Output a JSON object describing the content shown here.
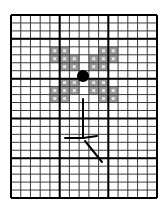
{
  "grid": {
    "left": 11,
    "top": 15,
    "right": 157,
    "bottom": 198,
    "cols": 15,
    "rows": 23,
    "major_cols": [
      0,
      5,
      10,
      15
    ],
    "major_rows": [
      0,
      3,
      8,
      13,
      18,
      23
    ],
    "minor_color": "#3a3a3a",
    "major_color": "#000000",
    "minor_width": 1,
    "major_width": 2
  },
  "shaded_cells": {
    "fill": "#9a9a9a",
    "center_mark": "#e6e6e6",
    "cells": [
      [
        4,
        4
      ],
      [
        4,
        5
      ],
      [
        5,
        4
      ],
      [
        5,
        5
      ],
      [
        5,
        6
      ],
      [
        6,
        5
      ],
      [
        6,
        6
      ],
      [
        4,
        9
      ],
      [
        4,
        10
      ],
      [
        5,
        8
      ],
      [
        5,
        9
      ],
      [
        5,
        10
      ],
      [
        6,
        8
      ],
      [
        6,
        9
      ],
      [
        8,
        5
      ],
      [
        8,
        6
      ],
      [
        9,
        4
      ],
      [
        9,
        5
      ],
      [
        9,
        6
      ],
      [
        10,
        4
      ],
      [
        10,
        5
      ],
      [
        8,
        8
      ],
      [
        8,
        9
      ],
      [
        9,
        8
      ],
      [
        9,
        9
      ],
      [
        9,
        10
      ],
      [
        10,
        9
      ],
      [
        10,
        10
      ]
    ]
  },
  "center_dot": {
    "cx": 83,
    "cy": 76,
    "r": 6,
    "color": "#000000"
  },
  "strokes": {
    "color": "#000000",
    "width": 2,
    "lines": [
      {
        "name": "vertical-stem",
        "x1": 83,
        "y1": 99,
        "x2": 83,
        "y2": 138
      },
      {
        "name": "left-arm",
        "x1": 65,
        "y1": 138,
        "x2": 83,
        "y2": 138
      },
      {
        "name": "right-arm",
        "x1": 83,
        "y1": 138,
        "x2": 97,
        "y2": 136
      },
      {
        "name": "diagonal-leg",
        "x1": 85,
        "y1": 141,
        "x2": 102,
        "y2": 162
      }
    ]
  }
}
